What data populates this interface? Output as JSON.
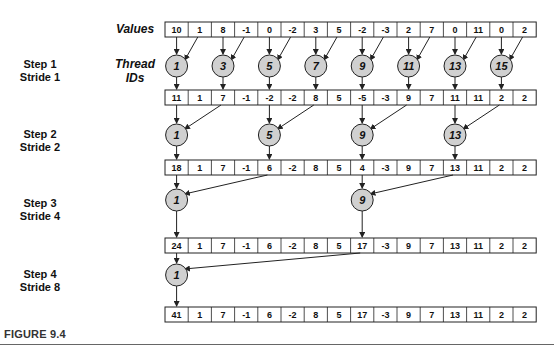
{
  "labels": {
    "values": "Values",
    "thread_ids_line1": "Thread",
    "thread_ids_line2": "IDs",
    "figure_caption": "FIGURE 9.4"
  },
  "steps": [
    {
      "step": "Step 1",
      "stride": "Stride 1",
      "threads": [
        1,
        3,
        5,
        7,
        9,
        11,
        13,
        15
      ],
      "stride_n": 1
    },
    {
      "step": "Step 2",
      "stride": "Stride 2",
      "threads": [
        1,
        5,
        9,
        13
      ],
      "stride_n": 2
    },
    {
      "step": "Step 3",
      "stride": "Stride 4",
      "threads": [
        1,
        9
      ],
      "stride_n": 4
    },
    {
      "step": "Step 4",
      "stride": "Stride 8",
      "threads": [
        1
      ],
      "stride_n": 8
    }
  ],
  "arrays": [
    [
      10,
      1,
      8,
      -1,
      0,
      -2,
      3,
      5,
      -2,
      -3,
      2,
      7,
      0,
      11,
      0,
      2
    ],
    [
      11,
      1,
      7,
      -1,
      -2,
      -2,
      8,
      5,
      -5,
      -3,
      9,
      7,
      11,
      11,
      2,
      2
    ],
    [
      18,
      1,
      7,
      -1,
      6,
      -2,
      8,
      5,
      4,
      -3,
      9,
      7,
      13,
      11,
      2,
      2
    ],
    [
      24,
      1,
      7,
      -1,
      6,
      -2,
      8,
      5,
      17,
      -3,
      9,
      7,
      13,
      11,
      2,
      2
    ],
    [
      41,
      1,
      7,
      -1,
      6,
      -2,
      8,
      5,
      17,
      -3,
      9,
      7,
      13,
      11,
      2,
      2
    ]
  ],
  "colors": {
    "circle_fill": "#d0d0d0",
    "stroke": "#222222",
    "text": "#111111"
  }
}
